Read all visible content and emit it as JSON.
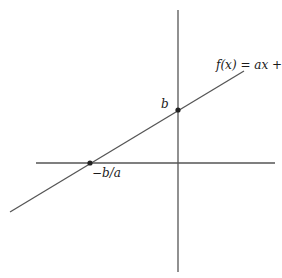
{
  "diagram": {
    "function_label": "f(x) = ax + b",
    "y_intercept_label": "b",
    "x_intercept_label": "−b/a",
    "colors": {
      "axis": "#555555",
      "line": "#555555",
      "point": "#222222",
      "text": "#1a1a1a"
    },
    "axes": {
      "x_axis": {
        "x1": 36,
        "y1": 163,
        "x2": 275,
        "y2": 163
      },
      "y_axis": {
        "x1": 178,
        "y1": 10,
        "x2": 178,
        "y2": 272
      }
    },
    "line": {
      "x1": 10,
      "y1": 212,
      "x2": 244,
      "y2": 71
    },
    "points": [
      {
        "name": "x-intercept",
        "cx": 90,
        "cy": 163,
        "label": "−b/a"
      },
      {
        "name": "y-intercept",
        "cx": 178,
        "cy": 110,
        "label": "b"
      }
    ]
  }
}
